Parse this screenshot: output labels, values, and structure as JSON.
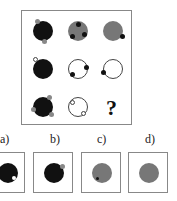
{
  "puzzle": {
    "type": "3x3 matrix reasoning",
    "question_mark": "?",
    "grid": [
      [
        {
          "circle": "black",
          "dots": [
            {
              "color": "gray",
              "pos": "top"
            },
            {
              "color": "gray",
              "pos": "bottom"
            }
          ]
        },
        {
          "circle": "gray",
          "dots": [
            {
              "color": "black",
              "pos": "top"
            },
            {
              "color": "black",
              "pos": "bottom-left"
            },
            {
              "color": "black",
              "pos": "bottom-right"
            }
          ]
        },
        {
          "circle": "gray",
          "dots": [
            {
              "color": "black",
              "pos": "bottom-right"
            }
          ]
        }
      ],
      [
        {
          "circle": "black",
          "dots": [
            {
              "color": "white",
              "pos": "top-left"
            }
          ]
        },
        {
          "circle": "white",
          "dots": [
            {
              "color": "black",
              "pos": "right"
            },
            {
              "color": "black",
              "pos": "bottom-left"
            }
          ]
        },
        {
          "circle": "white",
          "dots": [
            {
              "color": "black",
              "pos": "left"
            }
          ]
        }
      ],
      [
        {
          "circle": "black",
          "dots": [
            {
              "color": "gray",
              "pos": "top-right"
            },
            {
              "color": "gray",
              "pos": "left"
            },
            {
              "color": "gray",
              "pos": "bottom-right"
            }
          ]
        },
        {
          "circle": "white",
          "dots": [
            {
              "color": "white",
              "pos": "top-left"
            },
            {
              "color": "white",
              "pos": "bottom-right"
            }
          ]
        },
        {
          "missing": true
        }
      ]
    ]
  },
  "options": [
    {
      "label": "a)",
      "circle": "black",
      "dots": [
        {
          "color": "white",
          "pos": "bottom-right-inner"
        }
      ]
    },
    {
      "label": "b)",
      "circle": "black",
      "dots": [
        {
          "color": "gray",
          "pos": "top-right"
        }
      ]
    },
    {
      "label": "c)",
      "circle": "gray",
      "dots": [
        {
          "color": "black",
          "pos": "bottom-left-inner"
        }
      ]
    },
    {
      "label": "d)",
      "circle": "gray",
      "dots": []
    }
  ]
}
